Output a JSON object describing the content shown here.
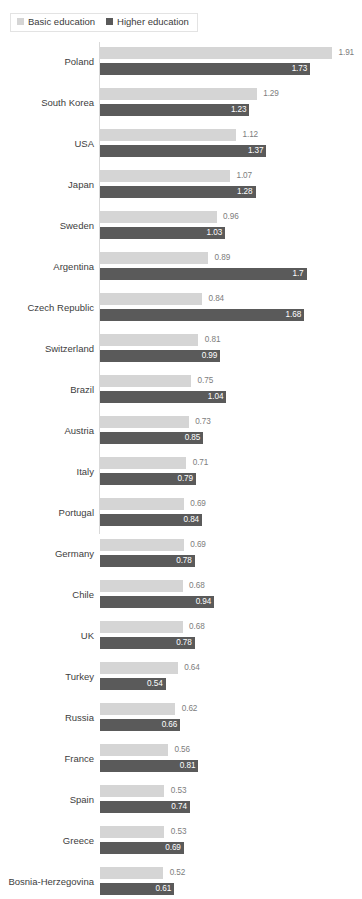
{
  "legend": {
    "position": "top-left",
    "entries": [
      {
        "label": "Basic education",
        "color": "#d5d5d5",
        "swatch_name": "legend-swatch-basic"
      },
      {
        "label": "Higher education",
        "color": "#5a5a5a",
        "swatch_name": "legend-swatch-higher"
      }
    ]
  },
  "edge_text": {
    "top": "",
    "bottom": ""
  },
  "chart_data": {
    "type": "bar",
    "orientation": "horizontal",
    "title": "",
    "subtitle": "",
    "xlabel": "",
    "ylabel": "",
    "xlim": [
      0,
      2.0
    ],
    "grid": false,
    "legend_position": "top-left",
    "categories": [
      "Poland",
      "South Korea",
      "USA",
      "Japan",
      "Sweden",
      "Argentina",
      "Czech Republic",
      "Switzerland",
      "Brazil",
      "Austria",
      "Italy",
      "Portugal",
      "Germany",
      "Chile",
      "UK",
      "Turkey",
      "Russia",
      "France",
      "Spain",
      "Greece",
      "Bosnia-Herzegovina"
    ],
    "series": [
      {
        "name": "Basic education",
        "color": "#d5d5d5",
        "values": [
          1.91,
          1.29,
          1.12,
          1.07,
          0.96,
          0.89,
          0.84,
          0.81,
          0.75,
          0.73,
          0.71,
          0.69,
          0.69,
          0.68,
          0.68,
          0.64,
          0.62,
          0.56,
          0.53,
          0.53,
          0.52
        ],
        "labels": [
          "1.91",
          "1.29",
          "1.12",
          "1.07",
          "0.96",
          "0.89",
          "0.84",
          "0.81",
          "0.75",
          "0.73",
          "0.71",
          "0.69",
          "0.69",
          "0.68",
          "0.68",
          "0.64",
          "0.62",
          "0.56",
          "0.53",
          "0.53",
          "0.52"
        ]
      },
      {
        "name": "Higher education",
        "color": "#5a5a5a",
        "values": [
          1.73,
          1.23,
          1.37,
          1.28,
          1.03,
          1.7,
          1.68,
          0.99,
          1.04,
          0.85,
          0.79,
          0.84,
          0.78,
          0.94,
          0.78,
          0.54,
          0.66,
          0.81,
          0.74,
          0.69,
          0.61
        ],
        "labels": [
          "1.73",
          "1.23",
          "1.37",
          "1.28",
          "1.03",
          "1.7",
          "1.68",
          "0.99",
          "1.04",
          "0.85",
          "0.79",
          "0.84",
          "0.78",
          "0.94",
          "0.78",
          "0.54",
          "0.66",
          "0.81",
          "0.74",
          "0.69",
          "0.61"
        ]
      }
    ]
  }
}
